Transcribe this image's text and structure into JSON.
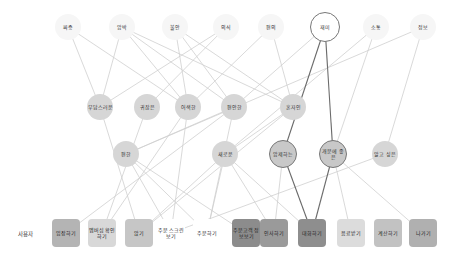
{
  "diagram": {
    "row1": [
      {
        "id": "a1",
        "label": "짜증",
        "x": 68,
        "y": 27,
        "style": "top"
      },
      {
        "id": "a2",
        "label": "압박",
        "x": 122,
        "y": 27,
        "style": "top"
      },
      {
        "id": "a3",
        "label": "불안",
        "x": 175,
        "y": 27,
        "style": "top"
      },
      {
        "id": "a4",
        "label": "의식",
        "x": 226,
        "y": 27,
        "style": "top"
      },
      {
        "id": "a5",
        "label": "편의",
        "x": 271,
        "y": 27,
        "style": "top"
      },
      {
        "id": "a6",
        "label": "재미",
        "x": 325,
        "y": 27,
        "style": "top-outlined"
      },
      {
        "id": "a7",
        "label": "소통",
        "x": 376,
        "y": 27,
        "style": "top"
      },
      {
        "id": "a8",
        "label": "정보",
        "x": 423,
        "y": 27,
        "style": "top"
      }
    ],
    "row2": [
      {
        "id": "b1",
        "label": "부담스러운",
        "x": 100,
        "y": 107
      },
      {
        "id": "b2",
        "label": "귀찮은",
        "x": 147,
        "y": 107
      },
      {
        "id": "b3",
        "label": "어색한",
        "x": 188,
        "y": 107
      },
      {
        "id": "b4",
        "label": "편안한",
        "x": 234,
        "y": 107
      },
      {
        "id": "b5",
        "label": "혼자인",
        "x": 293,
        "y": 107
      }
    ],
    "row3": [
      {
        "id": "c1",
        "label": "편한",
        "x": 126,
        "y": 154,
        "style": "mid"
      },
      {
        "id": "c2",
        "label": "새로운",
        "x": 225,
        "y": 154,
        "style": "mid"
      },
      {
        "id": "c3",
        "label": "압제하는",
        "x": 283,
        "y": 154,
        "style": "mid-outlined"
      },
      {
        "id": "c4",
        "label": "개분에 좋은",
        "x": 333,
        "y": 154,
        "style": "mid-outlined"
      },
      {
        "id": "c5",
        "label": "알고 싶은",
        "x": 385,
        "y": 154,
        "style": "mid"
      }
    ],
    "row_label": "사용자",
    "actions": [
      {
        "id": "d1",
        "label": "입장하기",
        "x": 66,
        "color": "#b4b4b4"
      },
      {
        "id": "d2",
        "label": "멤버십 확인하기",
        "x": 102,
        "color": "#d8d8d8"
      },
      {
        "id": "d3",
        "label": "앉기",
        "x": 139,
        "color": "#c6c6c6"
      },
      {
        "id": "d4",
        "label": "주문 스크린 보기",
        "x": 171,
        "color": "#ffffff"
      },
      {
        "id": "d5",
        "label": "주문하기",
        "x": 207,
        "color": "#ffffff"
      },
      {
        "id": "d6",
        "label": "주문고객 정보보기",
        "x": 246,
        "color": "#8c8c8c"
      },
      {
        "id": "d7",
        "label": "인사하기",
        "x": 274,
        "color": "#9a9a9a"
      },
      {
        "id": "d8",
        "label": "대화하기",
        "x": 312,
        "color": "#8e8e8e"
      },
      {
        "id": "d9",
        "label": "음료받기",
        "x": 351,
        "color": "#dcdcdc"
      },
      {
        "id": "d10",
        "label": "계산하기",
        "x": 388,
        "color": "#c2c2c2"
      },
      {
        "id": "d11",
        "label": "나가기",
        "x": 423,
        "color": "#b0b0b0"
      }
    ],
    "edges_light": [
      [
        "a1",
        "b1"
      ],
      [
        "a1",
        "b3"
      ],
      [
        "a2",
        "b1"
      ],
      [
        "a2",
        "b4"
      ],
      [
        "a2",
        "b5"
      ],
      [
        "a2",
        "b3"
      ],
      [
        "a3",
        "b3"
      ],
      [
        "a3",
        "b4"
      ],
      [
        "a3",
        "b5"
      ],
      [
        "a4",
        "b1"
      ],
      [
        "a4",
        "b2"
      ],
      [
        "a5",
        "b3"
      ],
      [
        "a5",
        "b5"
      ],
      [
        "a6",
        "b4"
      ],
      [
        "a7",
        "c2"
      ],
      [
        "a7",
        "c4"
      ],
      [
        "a8",
        "c1"
      ],
      [
        "a8",
        "c5"
      ],
      [
        "b1",
        "d3"
      ],
      [
        "b3",
        "d2"
      ],
      [
        "b3",
        "d4"
      ],
      [
        "b4",
        "c1"
      ],
      [
        "b4",
        "d1"
      ],
      [
        "b5",
        "d3"
      ],
      [
        "b5",
        "c2"
      ],
      [
        "c1",
        "d6"
      ],
      [
        "c1",
        "d4"
      ],
      [
        "c1",
        "d5"
      ],
      [
        "c2",
        "d3"
      ],
      [
        "c2",
        "d7"
      ],
      [
        "c2",
        "d8"
      ],
      [
        "c2",
        "d5"
      ],
      [
        "c3",
        "d7"
      ],
      [
        "c4",
        "d9"
      ],
      [
        "c4",
        "d11"
      ],
      [
        "c5",
        "d4"
      ],
      [
        "b2",
        "d2"
      ],
      [
        "b4",
        "d5"
      ]
    ],
    "edges_dark": [
      [
        "a6",
        "c3"
      ],
      [
        "a6",
        "c4"
      ],
      [
        "c3",
        "d8"
      ],
      [
        "c4",
        "d8"
      ]
    ]
  }
}
